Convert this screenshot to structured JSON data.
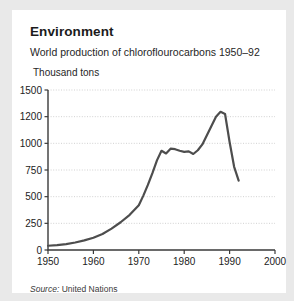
{
  "card": {
    "title": "Environment",
    "subtitle": "World production of chloroflourocarbons 1950–92",
    "y_axis_label": "Thousand tons",
    "source_prefix": "Source:",
    "source_value": " United Nations"
  },
  "chart_data": {
    "type": "line",
    "title": "World production of chloroflourocarbons 1950–92",
    "xlabel": "",
    "ylabel": "Thousand tons",
    "xlim": [
      1950,
      2000
    ],
    "ylim": [
      0,
      1500
    ],
    "grid": true,
    "legend": "none",
    "ytick_labels": [
      "0",
      "250",
      "500",
      "750",
      "1000",
      "1200",
      "1500"
    ],
    "ytick_values": [
      0,
      250,
      500,
      750,
      1000,
      1200,
      1500
    ],
    "xtick_labels": [
      "1950",
      "1960",
      "1970",
      "1980",
      "1990",
      "2000"
    ],
    "xtick_values": [
      1950,
      1960,
      1970,
      1980,
      1990,
      2000
    ],
    "series": [
      {
        "name": "World CFC production",
        "color": "#4d4d4d",
        "x": [
          1950,
          1952,
          1954,
          1956,
          1958,
          1960,
          1962,
          1964,
          1966,
          1968,
          1970,
          1971,
          1972,
          1973,
          1974,
          1975,
          1976,
          1977,
          1978,
          1979,
          1980,
          1981,
          1982,
          1983,
          1984,
          1985,
          1986,
          1987,
          1988,
          1989,
          1990,
          1991,
          1992
        ],
        "y": [
          40,
          45,
          55,
          70,
          90,
          115,
          150,
          200,
          260,
          330,
          420,
          510,
          610,
          720,
          840,
          930,
          905,
          950,
          945,
          930,
          920,
          925,
          900,
          935,
          990,
          1060,
          1130,
          1200,
          1255,
          1230,
          1010,
          780,
          650
        ]
      }
    ],
    "annotations": {
      "peak_year": 1988,
      "peak_value": 1255,
      "plateau_range_years": [
        1975,
        1983
      ],
      "plateau_value_approx": 925,
      "final_year": 1992,
      "final_value": 650
    }
  }
}
